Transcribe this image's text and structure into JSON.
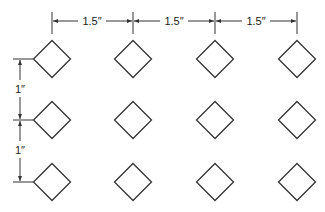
{
  "grid": {
    "columns": 4,
    "rows": 3,
    "shape": "diamond"
  },
  "horizontal_dimensions": [
    {
      "label": "1.5″",
      "from_column": 1,
      "to_column": 2
    },
    {
      "label": "1.5″",
      "from_column": 2,
      "to_column": 3
    },
    {
      "label": "1.5″",
      "from_column": 3,
      "to_column": 4
    }
  ],
  "vertical_dimensions": [
    {
      "label": "1″",
      "from_row": 1,
      "to_row": 2
    },
    {
      "label": "1″",
      "from_row": 2,
      "to_row": 3
    }
  ],
  "colors": {
    "line": "#333333",
    "background": "#ffffff"
  }
}
